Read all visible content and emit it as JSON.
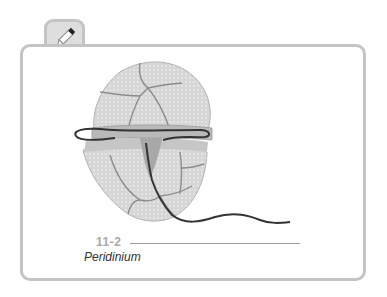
{
  "figure": {
    "number": "11-2",
    "caption": "Peridinium"
  },
  "icons": {
    "tab_icon": "pencil-icon"
  },
  "colors": {
    "frame": "#c4c4c4",
    "tab_fill": "#dedede",
    "cell_fill": "#d4d4d4",
    "plate_line": "#8c8c8c",
    "flagellum": "#3a3a3a",
    "caption_number": "#a8a8a8",
    "caption_text": "#333333"
  }
}
